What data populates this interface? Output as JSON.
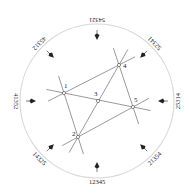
{
  "diagram": {
    "title": "",
    "points": [
      {
        "id": "1",
        "x": 64,
        "y": 93
      },
      {
        "id": "2",
        "x": 78,
        "y": 137
      },
      {
        "id": "3",
        "x": 98,
        "y": 101
      },
      {
        "id": "4",
        "x": 119,
        "y": 65
      },
      {
        "id": "5",
        "x": 133,
        "y": 107
      }
    ],
    "lines": [
      {
        "from": "1",
        "to": "4"
      },
      {
        "from": "1",
        "to": "5"
      },
      {
        "from": "1",
        "to": "2"
      },
      {
        "from": "2",
        "to": "4"
      },
      {
        "from": "2",
        "to": "5"
      },
      {
        "from": "4",
        "to": "5"
      }
    ],
    "permutations": [
      {
        "label": "54321",
        "direction_deg": 270
      },
      {
        "label": "52341",
        "direction_deg": 315
      },
      {
        "label": "25314",
        "direction_deg": 0
      },
      {
        "label": "21354",
        "direction_deg": 45
      },
      {
        "label": "12345",
        "direction_deg": 90
      },
      {
        "label": "14325",
        "direction_deg": 135
      },
      {
        "label": "41352",
        "direction_deg": 180
      },
      {
        "label": "45312",
        "direction_deg": 225
      }
    ],
    "colors": {
      "circle": "#d8d8d8",
      "lines": "#555555",
      "text": "#222222"
    }
  }
}
